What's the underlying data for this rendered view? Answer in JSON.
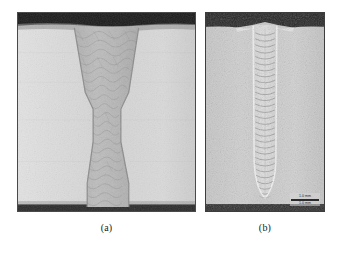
{
  "figure": {
    "panels": [
      {
        "id": "a",
        "caption": "(a)",
        "subject": "weld-cross-section-macrograph",
        "description": "hourglass shaped fusion zone narrowing to a waist",
        "border_color": "#4a4a4a",
        "base_color": "#d2d2d2",
        "fusion_zone_color": "#b4b4b4",
        "top_band_color": "#1c1c1c",
        "bottom_band_color": "#2a2a2a"
      },
      {
        "id": "b",
        "caption": "(b)",
        "subject": "keyhole-weld-macrograph",
        "description": "narrow vertical weld bead with ripple bands tapering to a root tip",
        "border_color": "#3d3d3d",
        "base_color": "#c9c9c9",
        "fusion_zone_color": "#dcdcdc",
        "top_band_color": "#262626",
        "scale_bar": {
          "label_top": "1.0 mm",
          "label_bottom": "1.0 mm"
        }
      }
    ]
  }
}
